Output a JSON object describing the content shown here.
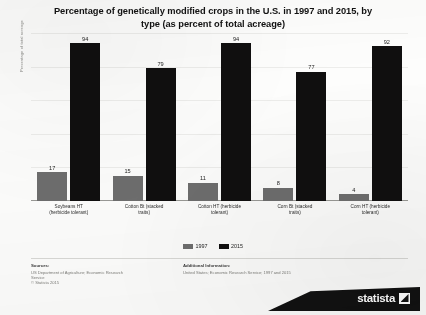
{
  "title": {
    "line1": "Percentage of genetically modified crops in the U.S. in 1997 and 2015, by",
    "line2": "type (as percent of total acreage)"
  },
  "y_axis_title": "Percentage of total acreage",
  "legend": {
    "items": [
      {
        "label": "1997",
        "color": "#6e6e6e"
      },
      {
        "label": "2015",
        "color": "#100f0f"
      }
    ]
  },
  "footer": {
    "sources_heading": "Sources:",
    "sources_line1": "US Department of Agriculture; Economic Research",
    "sources_line2": "Service",
    "sources_line3": "© Statista 2015",
    "additional_heading": "Additional Information:",
    "additional_line1": "United States; Economic Research Service; 1997 and 2015"
  },
  "logo": {
    "text": "statista",
    "mark": "statista-arrow-icon"
  },
  "chart_data": {
    "type": "bar",
    "title": "Percentage of genetically modified crops in the U.S. in 1997 and 2015, by type (as percent of total acreage)",
    "xlabel": "",
    "ylabel": "Percentage of total acreage",
    "ylim": [
      0,
      100
    ],
    "grid": true,
    "legend_position": "bottom",
    "categories": [
      "Soybeans HT (herbicide tolerant)",
      "Cotton Bt (stacked traits)",
      "Cotton HT (herbicide tolerant)",
      "Corn Bt (stacked traits)",
      "Corn HT (herbicide tolerant)"
    ],
    "category_lines": [
      [
        "Soybeans HT",
        "(herbicide tolerant)"
      ],
      [
        "Cotton Bt (stacked",
        "traits)"
      ],
      [
        "Cotton HT (herbicide",
        "tolerant)"
      ],
      [
        "Corn Bt (stacked",
        "traits)"
      ],
      [
        "Corn HT (herbicide",
        "tolerant)"
      ]
    ],
    "series": [
      {
        "name": "1997",
        "color": "#6e6e6e",
        "values": [
          17,
          15,
          11,
          8,
          4
        ]
      },
      {
        "name": "2015",
        "color": "#100f0f",
        "values": [
          94,
          79,
          94,
          77,
          92
        ]
      }
    ]
  }
}
